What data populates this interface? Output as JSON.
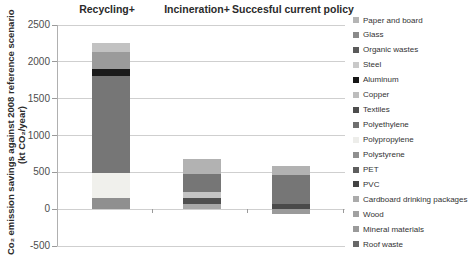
{
  "chart_data": {
    "type": "bar",
    "stacked": true,
    "title": "",
    "ylabel_line1": "Co₂ emission savings against 2008 reference scenario",
    "ylabel_line2": "(kt CO₂/year)",
    "ylim": [
      -500,
      2500
    ],
    "yticks": [
      2500,
      2000,
      1500,
      1000,
      500,
      0,
      -500
    ],
    "grid": true,
    "legend_position": "right",
    "categories": [
      "Recycling+",
      "Incineration+",
      "Succesful current policy"
    ],
    "bars": [
      {
        "category": "Recycling+",
        "total_positive": 2260,
        "total_negative": 0,
        "segments": [
          {
            "material": "Polystyrene",
            "value": 145,
            "color": "#8f8f8f"
          },
          {
            "material": "Polypropylene",
            "value": 345,
            "color": "#f0f0ec"
          },
          {
            "material": "Textiles",
            "value": 1320,
            "color": "#767676"
          },
          {
            "material": "Aluminum",
            "value": 90,
            "color": "#1b1b1b"
          },
          {
            "material": "Glass",
            "value": 230,
            "color": "#9b9b9b"
          },
          {
            "material": "Paper and board",
            "value": 130,
            "color": "#c2c2c2"
          }
        ]
      },
      {
        "category": "Incineration+",
        "total_positive": 685,
        "total_negative": 0,
        "segments": [
          {
            "material": "Wood",
            "value": 70,
            "color": "#a8a8a8"
          },
          {
            "material": "PVC",
            "value": 80,
            "color": "#4f4f4f"
          },
          {
            "material": "Cardboard drinking packages",
            "value": 80,
            "color": "#c4c4c4"
          },
          {
            "material": "Organic wastes",
            "value": 250,
            "color": "#767676"
          },
          {
            "material": "Paper and board",
            "value": 205,
            "color": "#b2b2b2"
          }
        ]
      },
      {
        "category": "Succesful current policy",
        "total_positive": 585,
        "total_negative": -70,
        "segments": [
          {
            "material": "Mineral materials",
            "value": -70,
            "color": "#9a9a9a"
          },
          {
            "material": "PVC",
            "value": 65,
            "color": "#4a4a4a"
          },
          {
            "material": "Organic wastes",
            "value": 395,
            "color": "#767676"
          },
          {
            "material": "Paper and board",
            "value": 125,
            "color": "#b2b2b2"
          }
        ]
      }
    ],
    "legend": [
      {
        "label": "Paper and board",
        "color": "#b5b5b5"
      },
      {
        "label": "Glass",
        "color": "#8a8a8a"
      },
      {
        "label": "Organic wastes",
        "color": "#5a5a5a"
      },
      {
        "label": "Steel",
        "color": "#c9c9c9"
      },
      {
        "label": "Aluminum",
        "color": "#161616"
      },
      {
        "label": "Copper",
        "color": "#bdbdbd"
      },
      {
        "label": "Textiles",
        "color": "#4d4d4d"
      },
      {
        "label": "Polyethylene",
        "color": "#6f6f6f"
      },
      {
        "label": "Polypropylene",
        "color": "#ededea"
      },
      {
        "label": "Polystyrene",
        "color": "#8f8f8f"
      },
      {
        "label": "PET",
        "color": "#5e5e5e"
      },
      {
        "label": "PVC",
        "color": "#434343"
      },
      {
        "label": "Cardboard drinking packages",
        "color": "#ababab"
      },
      {
        "label": "Wood",
        "color": "#a1a1a1"
      },
      {
        "label": "Mineral materials",
        "color": "#9a9a9a"
      },
      {
        "label": "Roof waste",
        "color": "#686868"
      }
    ]
  }
}
